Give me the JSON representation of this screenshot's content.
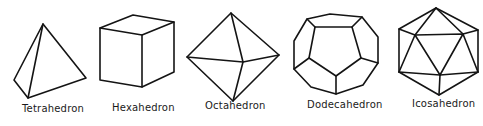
{
  "figure": {
    "type": "diagram",
    "solids": [
      {
        "name": "Tetrahedron",
        "label": "Tetrahedron"
      },
      {
        "name": "Hexahedron",
        "label": "Hexahedron"
      },
      {
        "name": "Octahedron",
        "label": "Octahedron"
      },
      {
        "name": "Dodecahedron",
        "label": "Dodecahedron"
      },
      {
        "name": "Icosahedron",
        "label": "Icosahedron"
      }
    ]
  },
  "colors": {
    "line": "#141414",
    "background": "#ffffff",
    "text": "#1a1a1a"
  }
}
